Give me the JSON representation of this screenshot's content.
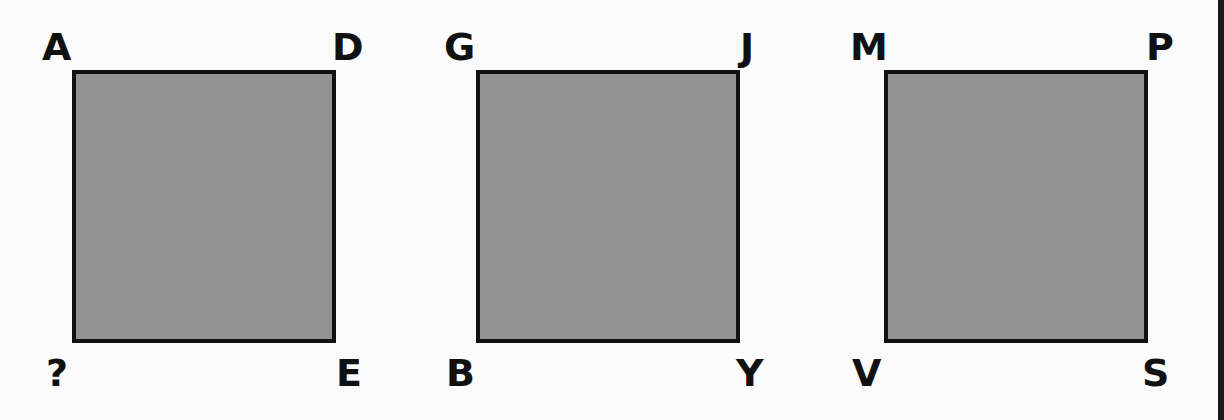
{
  "puzzle": {
    "squares": [
      {
        "top_left": "A",
        "top_right": "D",
        "bottom_left": "?",
        "bottom_right": "E"
      },
      {
        "top_left": "G",
        "top_right": "J",
        "bottom_left": "B",
        "bottom_right": "Y"
      },
      {
        "top_left": "M",
        "top_right": "P",
        "bottom_left": "V",
        "bottom_right": "S"
      }
    ],
    "colors": {
      "fill": "#939393",
      "border": "#111111",
      "background": "#fbfbfb"
    }
  }
}
